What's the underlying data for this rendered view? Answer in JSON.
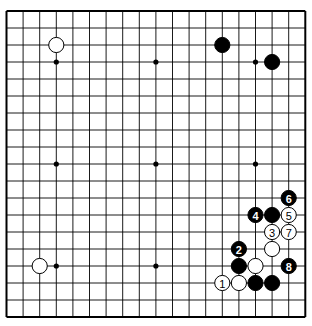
{
  "board": {
    "size": 19,
    "origin_x": 6.5,
    "origin_y": 11,
    "spacing_x": 16.6,
    "spacing_y": 17.0,
    "line_color": "#000000",
    "background": "#ffffff",
    "hoshi": [
      [
        3,
        3
      ],
      [
        9,
        3
      ],
      [
        15,
        3
      ],
      [
        3,
        9
      ],
      [
        9,
        9
      ],
      [
        15,
        9
      ],
      [
        3,
        15
      ],
      [
        9,
        15
      ],
      [
        15,
        15
      ]
    ]
  },
  "stones": [
    {
      "color": "white",
      "col": 3,
      "row": 2,
      "label": ""
    },
    {
      "color": "black",
      "col": 13,
      "row": 2,
      "label": ""
    },
    {
      "color": "black",
      "col": 16,
      "row": 3,
      "label": ""
    },
    {
      "color": "white",
      "col": 2,
      "row": 15,
      "label": ""
    },
    {
      "color": "black",
      "col": 17,
      "row": 11,
      "label": "6"
    },
    {
      "color": "black",
      "col": 15,
      "row": 12,
      "label": "4"
    },
    {
      "color": "black",
      "col": 16,
      "row": 12,
      "label": ""
    },
    {
      "color": "white",
      "col": 17,
      "row": 12,
      "label": "5"
    },
    {
      "color": "white",
      "col": 16,
      "row": 13,
      "label": "3"
    },
    {
      "color": "white",
      "col": 17,
      "row": 13,
      "label": "7"
    },
    {
      "color": "black",
      "col": 14,
      "row": 14,
      "label": "2"
    },
    {
      "color": "white",
      "col": 16,
      "row": 14,
      "label": ""
    },
    {
      "color": "black",
      "col": 14,
      "row": 15,
      "label": ""
    },
    {
      "color": "white",
      "col": 15,
      "row": 15,
      "label": ""
    },
    {
      "color": "black",
      "col": 17,
      "row": 15,
      "label": "8"
    },
    {
      "color": "white",
      "col": 13,
      "row": 16,
      "label": "1"
    },
    {
      "color": "white",
      "col": 14,
      "row": 16,
      "label": ""
    },
    {
      "color": "black",
      "col": 15,
      "row": 16,
      "label": ""
    },
    {
      "color": "black",
      "col": 16,
      "row": 16,
      "label": ""
    }
  ]
}
